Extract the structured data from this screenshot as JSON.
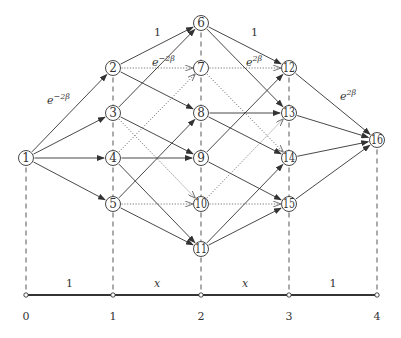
{
  "diagram": {
    "columns": [
      {
        "index": 0,
        "x": 26
      },
      {
        "index": 1,
        "x": 113
      },
      {
        "index": 2,
        "x": 201
      },
      {
        "index": 3,
        "x": 289
      },
      {
        "index": 4,
        "x": 377
      }
    ],
    "nodes": [
      {
        "id": "1",
        "col": 0,
        "y": 158
      },
      {
        "id": "2",
        "col": 1,
        "y": 68
      },
      {
        "id": "3",
        "col": 1,
        "y": 113
      },
      {
        "id": "4",
        "col": 1,
        "y": 158
      },
      {
        "id": "5",
        "col": 1,
        "y": 204
      },
      {
        "id": "6",
        "col": 2,
        "y": 23
      },
      {
        "id": "7",
        "col": 2,
        "y": 68
      },
      {
        "id": "8",
        "col": 2,
        "y": 113
      },
      {
        "id": "9",
        "col": 2,
        "y": 158
      },
      {
        "id": "10",
        "col": 2,
        "y": 204
      },
      {
        "id": "11",
        "col": 2,
        "y": 249
      },
      {
        "id": "12",
        "col": 3,
        "y": 68
      },
      {
        "id": "13",
        "col": 3,
        "y": 113
      },
      {
        "id": "14",
        "col": 3,
        "y": 158
      },
      {
        "id": "15",
        "col": 3,
        "y": 204
      },
      {
        "id": "16",
        "col": 4,
        "y": 140
      }
    ],
    "edges": [
      {
        "from": "1",
        "to": "2",
        "style": "solid"
      },
      {
        "from": "1",
        "to": "3",
        "style": "solid"
      },
      {
        "from": "1",
        "to": "4",
        "style": "solid"
      },
      {
        "from": "1",
        "to": "5",
        "style": "solid"
      },
      {
        "from": "2",
        "to": "6",
        "style": "solid"
      },
      {
        "from": "2",
        "to": "7",
        "style": "dotted"
      },
      {
        "from": "2",
        "to": "8",
        "style": "solid"
      },
      {
        "from": "3",
        "to": "6",
        "style": "solid"
      },
      {
        "from": "3",
        "to": "9",
        "style": "solid"
      },
      {
        "from": "3",
        "to": "10",
        "style": "dotted"
      },
      {
        "from": "4",
        "to": "7",
        "style": "dotted"
      },
      {
        "from": "4",
        "to": "9",
        "style": "solid"
      },
      {
        "from": "4",
        "to": "11",
        "style": "solid"
      },
      {
        "from": "5",
        "to": "8",
        "style": "solid"
      },
      {
        "from": "5",
        "to": "10",
        "style": "dotted"
      },
      {
        "from": "5",
        "to": "11",
        "style": "solid"
      },
      {
        "from": "6",
        "to": "12",
        "style": "solid"
      },
      {
        "from": "6",
        "to": "13",
        "style": "solid"
      },
      {
        "from": "7",
        "to": "12",
        "style": "dotted"
      },
      {
        "from": "7",
        "to": "14",
        "style": "dotted"
      },
      {
        "from": "8",
        "to": "13",
        "style": "solid"
      },
      {
        "from": "8",
        "to": "14",
        "style": "solid"
      },
      {
        "from": "9",
        "to": "12",
        "style": "solid"
      },
      {
        "from": "9",
        "to": "15",
        "style": "solid"
      },
      {
        "from": "10",
        "to": "13",
        "style": "dotted"
      },
      {
        "from": "10",
        "to": "15",
        "style": "dotted"
      },
      {
        "from": "11",
        "to": "14",
        "style": "solid"
      },
      {
        "from": "11",
        "to": "15",
        "style": "solid"
      },
      {
        "from": "12",
        "to": "16",
        "style": "solid"
      },
      {
        "from": "13",
        "to": "16",
        "style": "solid"
      },
      {
        "from": "14",
        "to": "16",
        "style": "solid"
      },
      {
        "from": "15",
        "to": "16",
        "style": "solid"
      }
    ],
    "edge_labels": [
      {
        "text": "e",
        "sup": "−2β",
        "x": 47,
        "y": 104
      },
      {
        "text": "1",
        "x": 154,
        "y": 36,
        "plain": true
      },
      {
        "text": "e",
        "sup": "−2β",
        "x": 152,
        "y": 66
      },
      {
        "text": "1",
        "x": 251,
        "y": 36,
        "plain": true
      },
      {
        "text": "e",
        "sup": "2β",
        "x": 246,
        "y": 66
      },
      {
        "text": "e",
        "sup": "2β",
        "x": 340,
        "y": 100
      }
    ],
    "axis": {
      "y": 295,
      "ticks": [
        "0",
        "1",
        "2",
        "3",
        "4"
      ],
      "segment_labels": [
        "1",
        "x",
        "1"
      ],
      "segments": [
        {
          "label": "1",
          "italic": false
        },
        {
          "label": "x",
          "italic": true
        },
        {
          "label": "x",
          "italic": true
        },
        {
          "label": "1",
          "italic": false
        }
      ]
    },
    "colors": {
      "stroke": "#333333",
      "dotted": "#555555",
      "background": "#ffffff"
    }
  }
}
